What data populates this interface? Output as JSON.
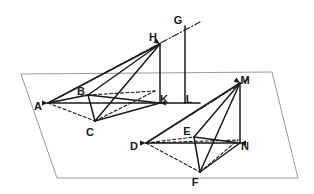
{
  "figure": {
    "canvas": {
      "width": 314,
      "height": 194
    },
    "colors": {
      "stroke": "#1a1a1a",
      "plane_stroke": "#9a9a9a",
      "background": "#ffffff"
    }
  },
  "plane": {
    "name": "base-plane",
    "points": "21,74 272,72 298,178 57,178",
    "stroke": "#9a9a9a",
    "stroke_width": 1
  },
  "vertices": [
    {
      "id": "A",
      "label": "A",
      "x": 48,
      "y": 103,
      "label_x": 38,
      "label_y": 107
    },
    {
      "id": "B",
      "label": "B",
      "x": 88,
      "y": 95,
      "label_x": 81,
      "label_y": 92
    },
    {
      "id": "C",
      "label": "C",
      "x": 95,
      "y": 121,
      "label_x": 90,
      "label_y": 133
    },
    {
      "id": "H",
      "label": "H",
      "x": 160,
      "y": 44,
      "label_x": 153,
      "label_y": 38
    },
    {
      "id": "K",
      "label": "K",
      "x": 160,
      "y": 103,
      "label_x": 164,
      "label_y": 100
    },
    {
      "id": "G",
      "label": "G",
      "x": 185,
      "y": 26,
      "label_x": 178,
      "label_y": 21
    },
    {
      "id": "L",
      "label": "L",
      "x": 185,
      "y": 103,
      "label_x": 189,
      "label_y": 100
    },
    {
      "id": "D",
      "label": "D",
      "x": 146,
      "y": 143,
      "label_x": 134,
      "label_y": 147
    },
    {
      "id": "E",
      "label": "E",
      "x": 194,
      "y": 137,
      "label_x": 187,
      "label_y": 132
    },
    {
      "id": "F",
      "label": "F",
      "x": 200,
      "y": 172,
      "label_x": 195,
      "label_y": 183
    },
    {
      "id": "M",
      "label": "M",
      "x": 240,
      "y": 83,
      "label_x": 245,
      "label_y": 81
    },
    {
      "id": "N",
      "label": "N",
      "x": 240,
      "y": 143,
      "label_x": 245,
      "label_y": 147
    }
  ],
  "edges": {
    "solid": [
      {
        "name": "edge-A-K",
        "from": "A",
        "to": "K"
      },
      {
        "name": "edge-A-B",
        "from": "A",
        "to": "B"
      },
      {
        "name": "edge-B-C",
        "from": "B",
        "to": "C"
      },
      {
        "name": "edge-B-K",
        "from": "B",
        "to": "K"
      },
      {
        "name": "edge-C-K",
        "from": "C",
        "to": "K"
      },
      {
        "name": "edge-A-H",
        "from": "A",
        "to": "H"
      },
      {
        "name": "edge-B-H",
        "from": "B",
        "to": "H"
      },
      {
        "name": "edge-C-H",
        "from": "C",
        "to": "H"
      },
      {
        "name": "edge-H-K",
        "from": "H",
        "to": "K"
      },
      {
        "name": "edge-G-L",
        "from": "G",
        "to": "L"
      },
      {
        "name": "edge-K-L",
        "from": "K",
        "to": "L"
      },
      {
        "name": "edge-L-extend",
        "from": "L",
        "to": "Lend"
      },
      {
        "name": "edge-D-N",
        "from": "D",
        "to": "N"
      },
      {
        "name": "edge-E-N",
        "from": "E",
        "to": "N"
      },
      {
        "name": "edge-E-F",
        "from": "E",
        "to": "F"
      },
      {
        "name": "edge-F-N",
        "from": "F",
        "to": "N"
      },
      {
        "name": "edge-D-M",
        "from": "D",
        "to": "M"
      },
      {
        "name": "edge-E-M",
        "from": "E",
        "to": "M"
      },
      {
        "name": "edge-F-M",
        "from": "F",
        "to": "M"
      },
      {
        "name": "edge-M-N",
        "from": "M",
        "to": "N"
      }
    ],
    "dashed": [
      {
        "name": "edge-A-B-dashed",
        "from": "A",
        "to": "B"
      },
      {
        "name": "edge-A-C-dashed",
        "from": "A",
        "to": "C"
      },
      {
        "name": "edge-B-Kd-dashed",
        "from": "B",
        "to": "Kd"
      },
      {
        "name": "edge-C-Kd-dashed",
        "from": "C",
        "to": "Kd"
      },
      {
        "name": "edge-D-E-dashed",
        "from": "D",
        "to": "E"
      },
      {
        "name": "edge-D-F-dashed",
        "from": "D",
        "to": "F"
      },
      {
        "name": "edge-D-Nd-dashed",
        "from": "D",
        "to": "Nd"
      },
      {
        "name": "edge-F-Nd-dashed",
        "from": "F",
        "to": "Nd"
      }
    ],
    "dashdot": [
      {
        "name": "ray-A-through-H-to-G",
        "from": "A",
        "to": "Gend"
      },
      {
        "name": "ray-D-through-E-to-M",
        "from": "D",
        "to": "Mend"
      }
    ]
  },
  "helper_points": {
    "Kd": {
      "x": 155,
      "y": 91
    },
    "Nd": {
      "x": 238,
      "y": 140
    },
    "Lend": {
      "x": 200,
      "y": 103
    },
    "Gend": {
      "x": 200,
      "y": 22
    },
    "Mend": {
      "x": 248,
      "y": 79
    }
  },
  "arrowheads": [
    {
      "name": "arrowhead-at-A",
      "x": 48,
      "y": 103,
      "angle": 180
    },
    {
      "name": "arrowhead-at-H",
      "x": 160,
      "y": 44,
      "angle": 214
    },
    {
      "name": "arrowhead-at-D",
      "x": 146,
      "y": 143,
      "angle": 180
    },
    {
      "name": "arrowhead-at-M",
      "x": 240,
      "y": 83,
      "angle": 214
    },
    {
      "name": "arrowhead-at-K",
      "x": 160,
      "y": 103,
      "angle": 0
    },
    {
      "name": "arrowhead-at-N",
      "x": 240,
      "y": 143,
      "angle": 0
    }
  ]
}
